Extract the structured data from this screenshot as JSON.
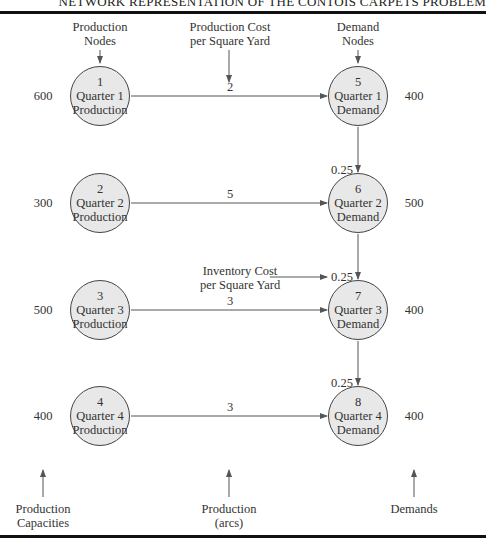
{
  "header": {
    "title": "NETWORK REPRESENTATION OF THE CONTOIS CARPETS PROBLEM"
  },
  "top_labels": {
    "production_nodes": [
      "Production",
      "Nodes"
    ],
    "production_cost": [
      "Production Cost",
      "per Square Yard"
    ],
    "demand_nodes": [
      "Demand",
      "Nodes"
    ]
  },
  "inventory_label": [
    "Inventory Cost",
    "per Square Yard"
  ],
  "bottom_labels": {
    "capacities": [
      "Production",
      "Capacities"
    ],
    "arcs": [
      "Production",
      "(arcs)"
    ],
    "demands": [
      "Demands"
    ]
  },
  "production_nodes": [
    {
      "id": "1",
      "line1": "Quarter 1",
      "line2": "Production",
      "capacity": "600"
    },
    {
      "id": "2",
      "line1": "Quarter 2",
      "line2": "Production",
      "capacity": "300"
    },
    {
      "id": "3",
      "line1": "Quarter 3",
      "line2": "Production",
      "capacity": "500"
    },
    {
      "id": "4",
      "line1": "Quarter 4",
      "line2": "Production",
      "capacity": "400"
    }
  ],
  "demand_nodes": [
    {
      "id": "5",
      "line1": "Quarter 1",
      "line2": "Demand",
      "demand": "400"
    },
    {
      "id": "6",
      "line1": "Quarter 2",
      "line2": "Demand",
      "demand": "500"
    },
    {
      "id": "7",
      "line1": "Quarter 3",
      "line2": "Demand",
      "demand": "400"
    },
    {
      "id": "8",
      "line1": "Quarter 4",
      "line2": "Demand",
      "demand": "400"
    }
  ],
  "production_costs": [
    "2",
    "5",
    "3",
    "3"
  ],
  "inventory_costs": [
    "0.25",
    "0.25",
    "0.25"
  ],
  "colors": {
    "node_fill": "#e8e8e8",
    "line": "#555555",
    "rule": "#111111"
  }
}
